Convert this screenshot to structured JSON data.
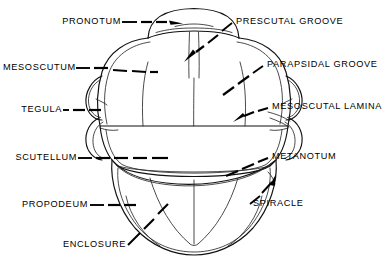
{
  "figure": {
    "background_color": "#ffffff",
    "line_color": "#111111",
    "text_color": "#000000",
    "width": 387,
    "height": 262
  },
  "labels": {
    "pronotum": "PRONOTUM",
    "mesoscutum": "MESOSCUTUM",
    "tegula": "TEGULA",
    "scutellum": "SCUTELLUM",
    "propodeum": "PROPODEUM",
    "enclosure": "ENCLOSURE",
    "prescutal_groove": "PRESCUTAL GROOVE",
    "parapsidal_groove": "PARAPSIDAL GROOVE",
    "mesoscutal_lamina": "MESOSCUTAL LAMINA",
    "metanotum": "METANOTUM",
    "spiracle": "SPIRACLE"
  }
}
